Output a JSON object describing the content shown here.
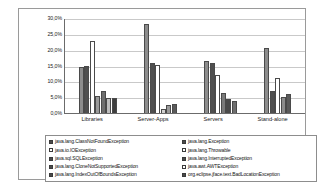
{
  "chart_data": {
    "type": "bar",
    "title": "",
    "subtitle": "",
    "xlabel": "",
    "ylabel": "",
    "ylim": [
      0,
      30
    ],
    "grid": true,
    "legend_position": "bottom",
    "y_ticks": [
      "0,0%",
      "5,0%",
      "10,0%",
      "15,0%",
      "20,0%",
      "25,0%",
      "30,0%"
    ],
    "categories": [
      "Libraries",
      "Server-Apps",
      "Servers",
      "Stand-alone"
    ],
    "series": [
      {
        "name": "java.lang.ClassNotFoundException",
        "swatch": "filled",
        "color": "#8c8c8c",
        "values": [
          14.5,
          28.2,
          16.3,
          20.4
        ]
      },
      {
        "name": "java.lang.Exception",
        "swatch": "filled",
        "color": "#4f4f4f",
        "values": [
          15.0,
          15.7,
          15.8,
          6.9
        ]
      },
      {
        "name": "java.io.IOException",
        "swatch": "hollow",
        "color": "#ffffff",
        "values": [
          22.6,
          15.1,
          11.9,
          10.9
        ]
      },
      {
        "name": "java.lang.Throwable",
        "swatch": "hollow",
        "color": "#ffffff",
        "values": [
          5.3,
          1.4,
          6.2,
          0.0
        ]
      },
      {
        "name": "java.sql.SQLException",
        "swatch": "filled",
        "color": "#9a9a9a",
        "values": [
          6.9,
          2.5,
          4.4,
          5.0
        ]
      },
      {
        "name": "java.lang.InterruptedException",
        "swatch": "filled",
        "color": "#6e6e6e",
        "values": [
          4.6,
          2.9,
          3.7,
          0.0
        ]
      },
      {
        "name": "java.lang.CloneNotSupportedException",
        "swatch": "filled",
        "color": "#5a5a5a",
        "values": [
          4.6,
          0.0,
          0.0,
          5.9
        ]
      },
      {
        "name": "java.awt.AWTException",
        "swatch": "hollow",
        "color": "#ffffff",
        "values": [
          0.0,
          0.0,
          0.0,
          0.0
        ]
      },
      {
        "name": "java.lang.IndexOutOfBoundsException",
        "swatch": "filled",
        "color": "#777777",
        "values": [
          0.0,
          0.0,
          0.0,
          0.0
        ]
      },
      {
        "name": "org.eclipse.jface.text.BadLocationException",
        "swatch": "filled",
        "color": "#3f3f3f",
        "values": [
          0.0,
          0.0,
          0.0,
          0.0
        ]
      }
    ],
    "bars": [
      {
        "group": "Libraries",
        "value": 14.5,
        "color": "#8c8c8c"
      },
      {
        "group": "Libraries",
        "value": 15.0,
        "color": "#4f4f4f"
      },
      {
        "group": "Libraries",
        "value": 22.6,
        "color": "#ffffff"
      },
      {
        "group": "Libraries",
        "value": 5.3,
        "color": "#9a9a9a"
      },
      {
        "group": "Libraries",
        "value": 6.9,
        "color": "#6e6e6e"
      },
      {
        "group": "Libraries",
        "value": 4.6,
        "color": "#bdbdbd"
      },
      {
        "group": "Libraries",
        "value": 4.6,
        "color": "#3f3f3f"
      },
      {
        "group": "Server-Apps",
        "value": 28.2,
        "color": "#8c8c8c"
      },
      {
        "group": "Server-Apps",
        "value": 15.7,
        "color": "#4f4f4f"
      },
      {
        "group": "Server-Apps",
        "value": 15.1,
        "color": "#ffffff"
      },
      {
        "group": "Server-Apps",
        "value": 1.4,
        "color": "#d0d0d0"
      },
      {
        "group": "Server-Apps",
        "value": 2.5,
        "color": "#9a9a9a"
      },
      {
        "group": "Server-Apps",
        "value": 2.9,
        "color": "#5a5a5a"
      },
      {
        "group": "Servers",
        "value": 16.3,
        "color": "#8c8c8c"
      },
      {
        "group": "Servers",
        "value": 15.8,
        "color": "#4f4f4f"
      },
      {
        "group": "Servers",
        "value": 11.9,
        "color": "#ffffff"
      },
      {
        "group": "Servers",
        "value": 6.2,
        "color": "#7a7a7a"
      },
      {
        "group": "Servers",
        "value": 4.4,
        "color": "#4a4a4a"
      },
      {
        "group": "Servers",
        "value": 3.7,
        "color": "#6e6e6e"
      },
      {
        "group": "Stand-alone",
        "value": 20.4,
        "color": "#8c8c8c"
      },
      {
        "group": "Stand-alone",
        "value": 6.9,
        "color": "#4f4f4f"
      },
      {
        "group": "Stand-alone",
        "value": 10.9,
        "color": "#ffffff"
      },
      {
        "group": "Stand-alone",
        "value": 5.0,
        "color": "#8c8c8c"
      },
      {
        "group": "Stand-alone",
        "value": 5.9,
        "color": "#5a5a5a"
      }
    ]
  },
  "legend": {
    "left": [
      {
        "label": "java.lang.ClassNotFoundException",
        "swatch": "filled"
      },
      {
        "label": "java.io.IOException",
        "swatch": "hollow"
      },
      {
        "label": "java.sql.SQLException",
        "swatch": "filled"
      },
      {
        "label": "java.lang.CloneNotSupportedException",
        "swatch": "filled"
      },
      {
        "label": "java.lang.IndexOutOfBoundsException",
        "swatch": "filled"
      }
    ],
    "right": [
      {
        "label": "java.lang.Exception",
        "swatch": "filled"
      },
      {
        "label": "java.lang.Throwable",
        "swatch": "hollow"
      },
      {
        "label": "java.lang.InterruptedException",
        "swatch": "filled"
      },
      {
        "label": "java.awt.AWTException",
        "swatch": "hollow"
      },
      {
        "label": "org.eclipse.jface.text.BadLocationException",
        "swatch": "filled"
      }
    ]
  }
}
